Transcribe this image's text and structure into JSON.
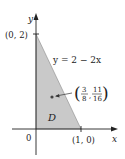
{
  "diagram": {
    "type": "region-plot",
    "axes": {
      "x_label": "x",
      "y_label": "y",
      "origin_label": "0"
    },
    "points": {
      "y_intercept": "(0, 2)",
      "x_intercept": "(1, 0)",
      "centroid": {
        "open": "(",
        "x_num": "3",
        "x_den": "8",
        "sep": ",",
        "y_num": "11",
        "y_den": "16",
        "close": ")"
      }
    },
    "line_equation": "y = 2 − 2x",
    "region_label": "D",
    "colors": {
      "region_fill": "#c9c9c9",
      "axis": "#222222",
      "boundary": "#555555",
      "point": "#444444"
    }
  }
}
